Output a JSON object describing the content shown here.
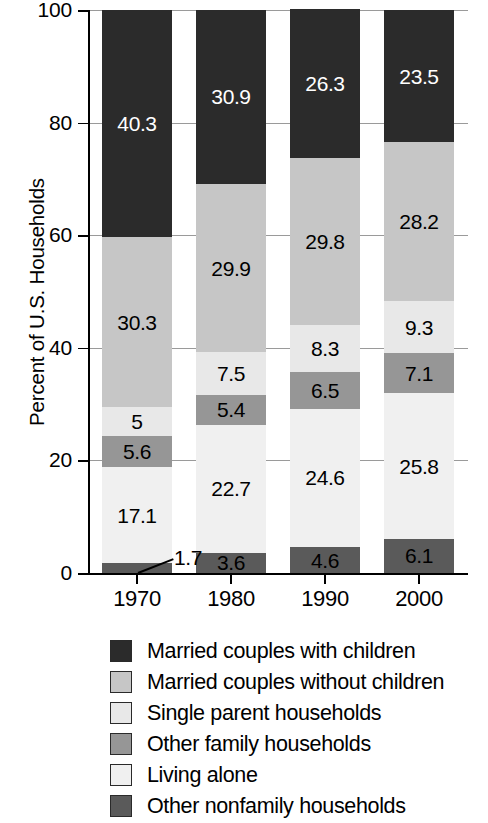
{
  "chart_data": {
    "type": "bar",
    "subtype": "stacked-bar-100-percent",
    "title": "",
    "xlabel": "",
    "ylabel": "Percent of U.S. Households",
    "ylim": [
      0,
      100
    ],
    "yticks": [
      0,
      20,
      40,
      60,
      80,
      100
    ],
    "ytick_labels": [
      "0",
      "20",
      "40",
      "60",
      "80",
      "100"
    ],
    "grid": true,
    "grid_axis": "y",
    "legend_position": "bottom",
    "categories": [
      "1970",
      "1980",
      "1990",
      "2000"
    ],
    "stack_order_bottom_to_top": [
      "Other nonfamily households",
      "Living alone",
      "Other family households",
      "Single parent households",
      "Married couples without children",
      "Married couples with children"
    ],
    "series": [
      {
        "name": "Married couples with children",
        "color": "#2b2b2b",
        "values": [
          40.3,
          30.9,
          26.3,
          23.5
        ],
        "labels": [
          "40.3",
          "30.9",
          "26.3",
          "23.5"
        ]
      },
      {
        "name": "Married couples without children",
        "color": "#c6c6c6",
        "values": [
          30.3,
          29.9,
          29.8,
          28.2
        ],
        "labels": [
          "30.3",
          "29.9",
          "29.8",
          "28.2"
        ]
      },
      {
        "name": "Single parent households",
        "color": "#e8e8e8",
        "values": [
          5,
          7.5,
          8.3,
          9.3
        ],
        "labels": [
          "5",
          "7.5",
          "8.3",
          "9.3"
        ]
      },
      {
        "name": "Other family households",
        "color": "#969696",
        "values": [
          5.6,
          5.4,
          6.5,
          7.1
        ],
        "labels": [
          "5.6",
          "5.4",
          "6.5",
          "7.1"
        ]
      },
      {
        "name": "Living alone",
        "color": "#f0f0f0",
        "values": [
          17.1,
          22.7,
          24.6,
          25.8
        ],
        "labels": [
          "17.1",
          "22.7",
          "24.6",
          "25.8"
        ]
      },
      {
        "name": "Other nonfamily households",
        "color": "#5a5a5a",
        "values": [
          1.7,
          3.6,
          4.6,
          6.1
        ],
        "labels": [
          "1.7",
          "3.6",
          "4.6",
          "6.1"
        ]
      }
    ],
    "callouts": [
      {
        "category": "1970",
        "series": "Other nonfamily households",
        "label": "1.7",
        "note": "value label placed outside slice with leader line"
      }
    ]
  },
  "axis": {
    "y_title": "Percent of U.S. Households",
    "y_tick_labels": [
      "100",
      "80",
      "60",
      "40",
      "20",
      "0"
    ],
    "x_tick_labels": [
      "1970",
      "1980",
      "1990",
      "2000"
    ]
  },
  "legend": {
    "items": [
      {
        "label": "Married couples with children",
        "color": "#2b2b2b"
      },
      {
        "label": "Married couples without children",
        "color": "#c6c6c6"
      },
      {
        "label": "Single parent households",
        "color": "#e8e8e8"
      },
      {
        "label": "Other family households",
        "color": "#969696"
      },
      {
        "label": "Living alone",
        "color": "#f0f0f0"
      },
      {
        "label": "Other nonfamily households",
        "color": "#5a5a5a"
      }
    ]
  }
}
